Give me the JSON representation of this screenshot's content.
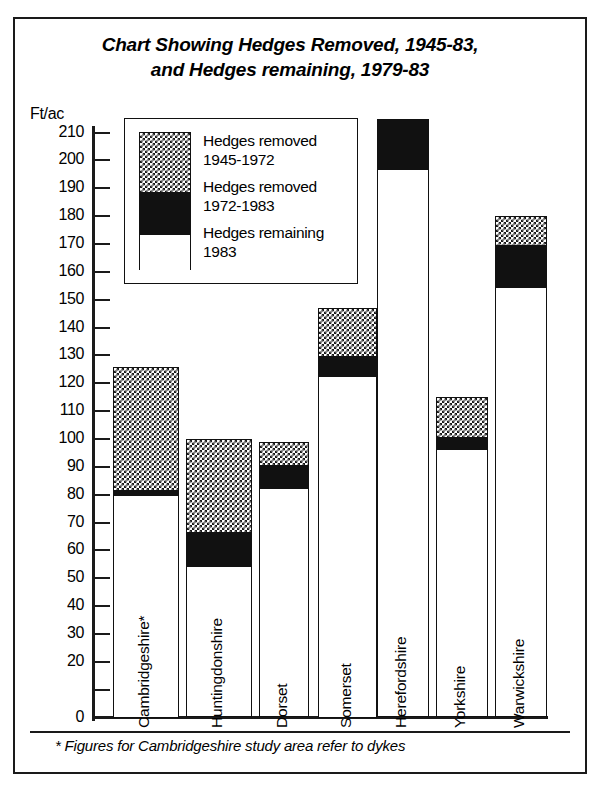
{
  "chart_data": {
    "type": "bar",
    "subtype": "stacked-vertical",
    "title": "Chart Showing Hedges Removed, 1945-83, and Hedges remaining, 1979-83",
    "title_line1": "Chart Showing Hedges Removed, 1945-83,",
    "title_line2": "and Hedges remaining, 1979-83",
    "xlabel": "",
    "ylabel": "Ft/ac",
    "ylim": [
      0,
      215
    ],
    "grid": false,
    "legend_position": "inside-top-left",
    "categories": [
      "Cambridgeshire*",
      "Huntingdonshire",
      "Dorset",
      "Somerset",
      "Herefordshire",
      "Yorkshire",
      "Warwickshire"
    ],
    "series": [
      {
        "name": "Hedges remaining 1983",
        "fill": "white",
        "values": [
          80,
          54.5,
          82.5,
          122.5,
          197,
          96.5,
          154.5
        ]
      },
      {
        "name": "Hedges removed 1972-1983",
        "fill": "black",
        "values": [
          2,
          12.5,
          8.5,
          7.5,
          18,
          4.5,
          15.5
        ]
      },
      {
        "name": "Hedges removed 1945-1972",
        "fill": "checkered",
        "values": [
          44,
          33,
          8,
          17,
          0,
          14,
          10
        ]
      }
    ],
    "totals": [
      126,
      100,
      99,
      147,
      215,
      115,
      180
    ],
    "ytick_labels": [
      "210",
      "200",
      "190",
      "180",
      "170",
      "160",
      "150",
      "140",
      "130",
      "120",
      "110",
      "100",
      "90",
      "80",
      "70",
      "60",
      "50",
      "40",
      "30",
      "20",
      "0"
    ],
    "ytick_values": [
      210,
      200,
      190,
      180,
      170,
      160,
      150,
      140,
      130,
      120,
      110,
      100,
      90,
      80,
      70,
      60,
      50,
      40,
      30,
      20,
      10,
      0
    ],
    "annotations": [
      "* Figures for Cambridgeshire study area refer to dykes"
    ]
  },
  "legend": {
    "entries": [
      {
        "label_line1": "Hedges removed",
        "label_line2": "1945-1972",
        "swatch": "checkered"
      },
      {
        "label_line1": "Hedges removed",
        "label_line2": "1972-1983",
        "swatch": "black"
      },
      {
        "label_line1": "Hedges remaining",
        "label_line2": "1983",
        "swatch": "white"
      }
    ]
  },
  "footnote": "* Figures for Cambridgeshire study area refer to dykes",
  "colors": {
    "ink": "#1a1a1a",
    "fill_removed_1945_1972": "#555555",
    "fill_removed_1972_1983": "#111111",
    "fill_remaining_1983": "#ffffff",
    "background": "#ffffff"
  }
}
